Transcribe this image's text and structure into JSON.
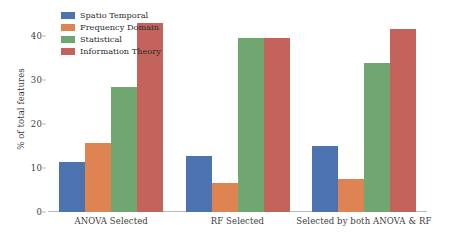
{
  "chart_data": {
    "type": "bar",
    "title": "",
    "xlabel": "",
    "ylabel": "% of total features",
    "ylim": [
      0,
      45
    ],
    "yticks": [
      0,
      10,
      20,
      30,
      40
    ],
    "ytick_labels": [
      "0",
      "10",
      "20",
      "30",
      "40"
    ],
    "grid": false,
    "legend_position": "upper left",
    "categories": [
      "ANOVA Selected",
      "RF Selected",
      "Selected by both ANOVA & RF"
    ],
    "series": [
      {
        "name": "Spatio Temporal",
        "color": "#4c72b0",
        "values": [
          11.4,
          12.7,
          15.0
        ]
      },
      {
        "name": "Frequency Domain",
        "color": "#dd8452",
        "values": [
          15.7,
          6.6,
          7.5
        ]
      },
      {
        "name": "Statistical",
        "color": "#70a770",
        "values": [
          28.5,
          39.5,
          33.8
        ]
      },
      {
        "name": "Information Theory",
        "color": "#c4625c",
        "values": [
          43.0,
          39.5,
          41.5
        ]
      }
    ]
  }
}
